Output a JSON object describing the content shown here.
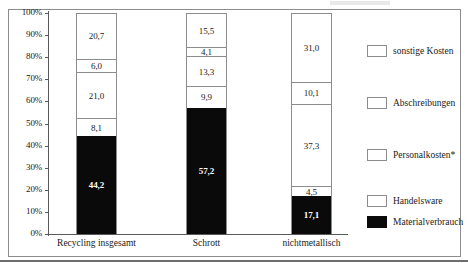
{
  "chart_data": {
    "type": "bar",
    "subtype": "stacked-100-percent",
    "title": "",
    "xlabel": "",
    "ylabel": "",
    "ylim": [
      0,
      100
    ],
    "ytick_labels": [
      "100%",
      "90%",
      "80%",
      "70%",
      "60%",
      "50%",
      "40%",
      "30%",
      "20%",
      "10%",
      "0%"
    ],
    "ytick_values": [
      100,
      90,
      80,
      70,
      60,
      50,
      40,
      30,
      20,
      10,
      0
    ],
    "grid": false,
    "legend_position": "right",
    "categories": [
      "Recycling insgesamt",
      "Schrott",
      "nichtmetallisch"
    ],
    "series": [
      {
        "name": "Materialverbrauch",
        "color": "#0a0a0a",
        "values": [
          44.2,
          57.2,
          17.1
        ],
        "labels": [
          "44,2",
          "57,2",
          "17,1"
        ]
      },
      {
        "name": "Handelsware",
        "color": "#ffffff",
        "values": [
          8.1,
          9.9,
          4.5
        ],
        "labels": [
          "8,1",
          "9,9",
          "4,5"
        ]
      },
      {
        "name": "Personalkosten*",
        "color": "#ffffff",
        "values": [
          21.0,
          13.3,
          37.3
        ],
        "labels": [
          "21,0",
          "13,3",
          "37,3"
        ]
      },
      {
        "name": "Abschreibungen",
        "color": "#ffffff",
        "values": [
          6.0,
          4.1,
          10.1
        ],
        "labels": [
          "6,0",
          "4,1",
          "10,1"
        ]
      },
      {
        "name": "sonstige Kosten",
        "color": "#ffffff",
        "values": [
          20.7,
          15.5,
          31.0
        ],
        "labels": [
          "20,7",
          "15,5",
          "31,0"
        ]
      }
    ]
  },
  "legend": {
    "entries": [
      {
        "label": "sonstige Kosten",
        "swatch": "light"
      },
      {
        "label": "Abschreibungen",
        "swatch": "light"
      },
      {
        "label": "Personalkosten*",
        "swatch": "light"
      },
      {
        "label": "Handelsware",
        "swatch": "light"
      },
      {
        "label": "Materialverbrauch",
        "swatch": "dark"
      }
    ]
  }
}
